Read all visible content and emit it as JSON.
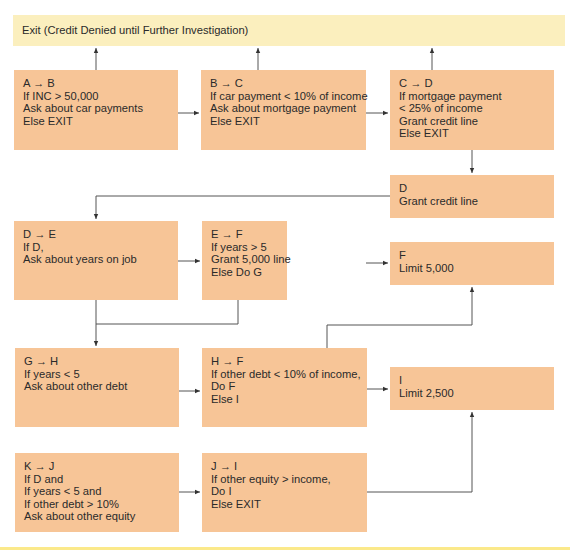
{
  "exit_box": {
    "label": "Exit (Credit Denied until Further Investigation)"
  },
  "nodes": {
    "ab": {
      "lines": [
        "A → B",
        "If INC > 50,000",
        "Ask about car payments",
        "Else EXIT"
      ]
    },
    "bc": {
      "lines": [
        "B → C",
        "If car payment < 10% of income",
        "Ask about mortgage payment",
        "Else EXIT"
      ]
    },
    "cd": {
      "lines": [
        "C → D",
        "If mortgage payment",
        "< 25% of income",
        "Grant credit line",
        "Else EXIT"
      ]
    },
    "d": {
      "lines": [
        "D",
        "Grant credit line"
      ]
    },
    "de": {
      "lines": [
        "D → E",
        "If D,",
        "Ask about years on job"
      ]
    },
    "ef": {
      "lines": [
        "E → F",
        "If years > 5",
        "Grant 5,000 line",
        "Else Do G"
      ]
    },
    "f": {
      "lines": [
        "F",
        "Limit 5,000"
      ]
    },
    "gh": {
      "lines": [
        "G → H",
        "If years < 5",
        "Ask about other debt"
      ]
    },
    "hf": {
      "lines": [
        "H → F",
        "If other debt < 10% of income,",
        "Do F",
        "Else I"
      ]
    },
    "i": {
      "lines": [
        "I",
        "Limit 2,500"
      ]
    },
    "kj": {
      "lines": [
        "K → J",
        "If D and",
        "If years < 5 and",
        "If other debt > 10%",
        "Ask about other equity"
      ]
    },
    "ji": {
      "lines": [
        "J → I",
        "If other equity > income,",
        "Do I",
        "Else EXIT"
      ]
    }
  },
  "colors": {
    "node_fill": "#f7c597",
    "exit_fill": "#fbefbe",
    "connector": "#555555"
  }
}
